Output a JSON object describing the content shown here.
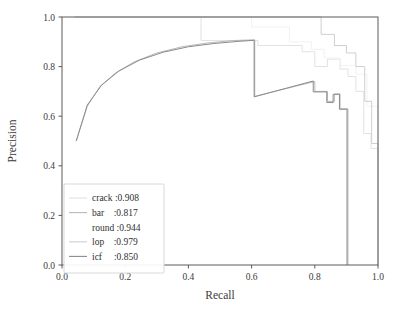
{
  "chart_data": {
    "type": "line",
    "title": "",
    "xlabel": "Recall",
    "ylabel": "Precision",
    "xlim": [
      0.0,
      1.0
    ],
    "ylim": [
      0.0,
      1.0
    ],
    "grid": false,
    "legend_position": "lower-left",
    "xticks": [
      "0.0",
      "0.2",
      "0.4",
      "0.6",
      "0.8",
      "1.0"
    ],
    "xtick_values": [
      0.0,
      0.2,
      0.4,
      0.6,
      0.8,
      1.0
    ],
    "yticks": [
      "0.0",
      "0.2",
      "0.4",
      "0.6",
      "0.8",
      "1.0"
    ],
    "ytick_values": [
      0.0,
      0.2,
      0.4,
      0.6,
      0.8,
      1.0
    ],
    "series": [
      {
        "name": "crack",
        "label": "crack :0.908",
        "class_name": "crack",
        "ap": 0.908,
        "color": "#e2e2e2",
        "points": [
          [
            0.04,
            1.0
          ],
          [
            0.44,
            1.0
          ],
          [
            0.44,
            0.905
          ],
          [
            0.62,
            0.905
          ],
          [
            0.62,
            0.885
          ],
          [
            0.76,
            0.885
          ],
          [
            0.76,
            0.86
          ],
          [
            0.8,
            0.86
          ],
          [
            0.8,
            0.8
          ],
          [
            0.84,
            0.8
          ],
          [
            0.84,
            0.83
          ],
          [
            0.88,
            0.83
          ],
          [
            0.88,
            0.79
          ],
          [
            0.905,
            0.79
          ],
          [
            0.905,
            0.76
          ],
          [
            0.93,
            0.76
          ],
          [
            0.93,
            0.7
          ],
          [
            0.955,
            0.7
          ],
          [
            0.955,
            0.53
          ],
          [
            0.978,
            0.53
          ],
          [
            0.978,
            0.47
          ],
          [
            1.0,
            0.47
          ],
          [
            1.0,
            0.0
          ]
        ]
      },
      {
        "name": "bar",
        "label": "bar    :0.817",
        "class_name": "bar",
        "ap": 0.817,
        "color": "#b9b9b9",
        "points": [
          [
            0.045,
            0.5
          ],
          [
            0.08,
            0.64
          ],
          [
            0.12,
            0.72
          ],
          [
            0.17,
            0.775
          ],
          [
            0.23,
            0.82
          ],
          [
            0.3,
            0.855
          ],
          [
            0.38,
            0.88
          ],
          [
            0.46,
            0.895
          ],
          [
            0.54,
            0.905
          ],
          [
            0.61,
            0.908
          ],
          [
            0.61,
            0.68
          ],
          [
            0.8,
            0.74
          ],
          [
            0.8,
            0.7
          ],
          [
            0.84,
            0.7
          ],
          [
            0.84,
            0.66
          ],
          [
            0.862,
            0.66
          ],
          [
            0.862,
            0.69
          ],
          [
            0.88,
            0.69
          ],
          [
            0.88,
            0.63
          ],
          [
            0.905,
            0.63
          ],
          [
            0.905,
            0.0
          ]
        ]
      },
      {
        "name": "round",
        "label": "round :0.944",
        "class_name": "round",
        "ap": 0.944,
        "color": "#f2f2f2",
        "points": [
          [
            0.04,
            1.0
          ],
          [
            0.6,
            1.0
          ],
          [
            0.6,
            0.96
          ],
          [
            0.72,
            0.96
          ],
          [
            0.72,
            0.9
          ],
          [
            0.79,
            0.9
          ],
          [
            0.79,
            0.87
          ],
          [
            0.83,
            0.87
          ],
          [
            0.83,
            0.835
          ],
          [
            0.88,
            0.835
          ],
          [
            0.88,
            0.805
          ],
          [
            0.93,
            0.805
          ],
          [
            0.93,
            0.77
          ],
          [
            0.965,
            0.77
          ],
          [
            0.965,
            0.64
          ],
          [
            1.0,
            0.64
          ],
          [
            1.0,
            0.0
          ]
        ]
      },
      {
        "name": "lop",
        "label": "lop    :0.979",
        "class_name": "lop",
        "ap": 0.979,
        "color": "#cfcfcf",
        "points": [
          [
            0.04,
            1.0
          ],
          [
            0.82,
            1.0
          ],
          [
            0.82,
            0.93
          ],
          [
            0.862,
            0.93
          ],
          [
            0.862,
            0.885
          ],
          [
            0.9,
            0.885
          ],
          [
            0.9,
            0.855
          ],
          [
            0.93,
            0.855
          ],
          [
            0.93,
            0.8
          ],
          [
            0.958,
            0.8
          ],
          [
            0.958,
            0.66
          ],
          [
            0.98,
            0.66
          ],
          [
            0.98,
            0.49
          ],
          [
            1.0,
            0.49
          ],
          [
            1.0,
            0.0
          ]
        ]
      },
      {
        "name": "icf",
        "label": "icf     :0.850",
        "class_name": "icf",
        "ap": 0.85,
        "color": "#8c8c8c",
        "points": [
          [
            0.045,
            0.5
          ],
          [
            0.08,
            0.645
          ],
          [
            0.125,
            0.725
          ],
          [
            0.18,
            0.782
          ],
          [
            0.245,
            0.826
          ],
          [
            0.32,
            0.858
          ],
          [
            0.4,
            0.88
          ],
          [
            0.48,
            0.893
          ],
          [
            0.56,
            0.902
          ],
          [
            0.608,
            0.906
          ],
          [
            0.608,
            0.678
          ],
          [
            0.795,
            0.742
          ],
          [
            0.795,
            0.698
          ],
          [
            0.838,
            0.698
          ],
          [
            0.838,
            0.655
          ],
          [
            0.858,
            0.655
          ],
          [
            0.858,
            0.688
          ],
          [
            0.878,
            0.688
          ],
          [
            0.878,
            0.628
          ],
          [
            0.902,
            0.628
          ],
          [
            0.902,
            0.0
          ]
        ]
      }
    ]
  },
  "legend": {
    "entries": [
      {
        "label": "crack :0.908",
        "swatch_visible": true
      },
      {
        "label": "bar    :0.817",
        "swatch_visible": true
      },
      {
        "label": "round :0.944",
        "swatch_visible": false
      },
      {
        "label": "lop    :0.979",
        "swatch_visible": true
      },
      {
        "label": "icf     :0.850",
        "swatch_visible": true
      }
    ]
  }
}
